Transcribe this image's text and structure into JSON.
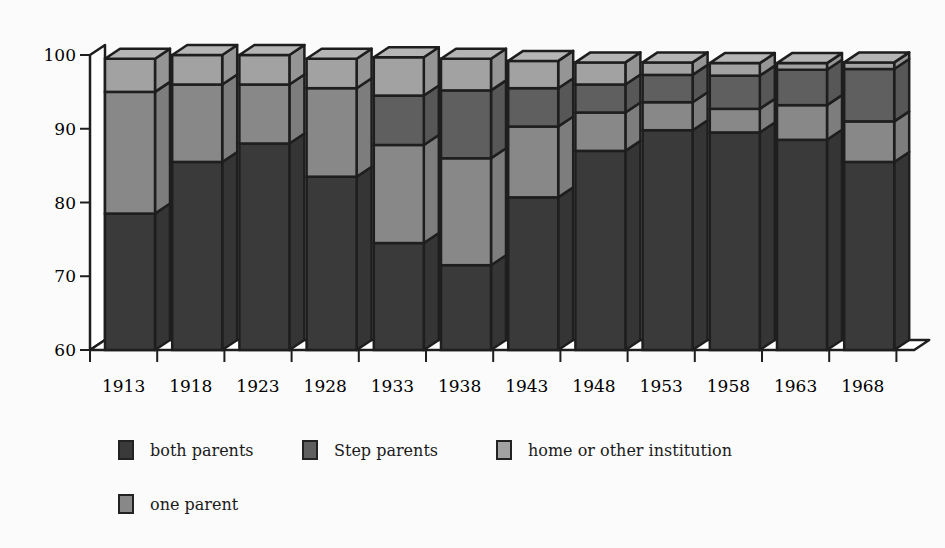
{
  "chart_data": {
    "type": "bar",
    "stacked": true,
    "style": "3d-stacked-bar-grayscale",
    "title": "",
    "xlabel": "",
    "ylabel": "",
    "ylim": [
      60,
      100
    ],
    "yticks": [
      60,
      70,
      80,
      90,
      100
    ],
    "grid": false,
    "legend_position": "bottom",
    "categories": [
      "1913",
      "1918",
      "1923",
      "1928",
      "1933",
      "1938",
      "1943",
      "1948",
      "1953",
      "1958",
      "1963",
      "1968"
    ],
    "series": [
      {
        "name": "both parents",
        "color": "#3a3a3a",
        "values": [
          78.5,
          85.5,
          88.0,
          83.5,
          74.5,
          71.5,
          80.7,
          87.0,
          89.8,
          89.5,
          88.5,
          85.5
        ]
      },
      {
        "name": "one parent",
        "color": "#888888",
        "values": [
          16.5,
          10.5,
          8.0,
          12.0,
          13.3,
          14.5,
          9.6,
          5.2,
          3.8,
          3.2,
          4.7,
          5.5
        ]
      },
      {
        "name": "Step parents",
        "color": "#5f5f5f",
        "values": [
          0,
          0,
          0,
          0,
          6.7,
          9.2,
          5.2,
          3.8,
          3.7,
          4.5,
          4.8,
          7.1
        ]
      },
      {
        "name": "home or other institution",
        "color": "#a2a2a2",
        "values": [
          4.5,
          4.0,
          4.0,
          4.0,
          5.2,
          4.3,
          3.7,
          3.0,
          1.7,
          1.7,
          0.9,
          0.9
        ]
      }
    ]
  },
  "legend": {
    "items": [
      {
        "label": "both parents",
        "color": "#3a3a3a"
      },
      {
        "label": "Step parents",
        "color": "#5f5f5f"
      },
      {
        "label": "home or other institution",
        "color": "#a2a2a2"
      },
      {
        "label": "one parent",
        "color": "#888888"
      }
    ]
  }
}
